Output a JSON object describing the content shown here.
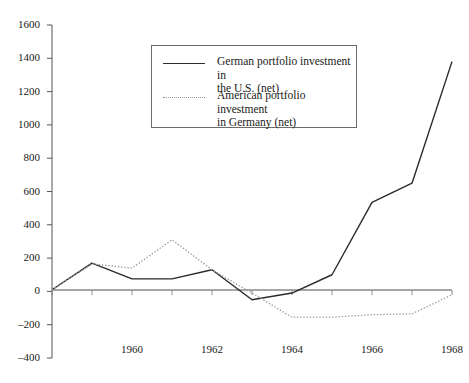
{
  "chart_data": {
    "type": "line",
    "title": "",
    "xlabel": "",
    "ylabel": "",
    "x": [
      1958,
      1959,
      1960,
      1961,
      1962,
      1963,
      1964,
      1965,
      1966,
      1967,
      1968
    ],
    "xlim": [
      1958,
      1968
    ],
    "ylim": [
      -400,
      1600
    ],
    "ytick_values": [
      -400,
      -200,
      0,
      200,
      400,
      600,
      800,
      1000,
      1200,
      1400,
      1600
    ],
    "ytick_labels": [
      "–400",
      "–200",
      "0",
      "200",
      "400",
      "600",
      "800",
      "1000",
      "1200",
      "1400",
      "1600"
    ],
    "xtick_values": [
      1960,
      1962,
      1964,
      1966,
      1968
    ],
    "xtick_labels": [
      "1960",
      "1962",
      "1964",
      "1966",
      "1968"
    ],
    "grid": false,
    "legend_position": "upper-center",
    "series": [
      {
        "name": "German portfolio investment in the U.S. (net)",
        "style": "solid",
        "color": "#2b2b2b",
        "values": [
          10,
          170,
          75,
          75,
          130,
          -50,
          -10,
          100,
          535,
          650,
          1380
        ]
      },
      {
        "name": "American portfolio investment in Germany (net)",
        "style": "dotted",
        "color": "#9a9a9a",
        "values": [
          10,
          165,
          140,
          310,
          130,
          -10,
          -155,
          -155,
          -140,
          -135,
          -20
        ]
      }
    ]
  },
  "legend": {
    "entries": [
      {
        "line1": "German portfolio investment in",
        "line2": "the U.S. (net)",
        "swatch": "solid-line-swatch"
      },
      {
        "line1": "American portfolio investment",
        "line2": "in Germany (net)",
        "swatch": "dotted-line-swatch"
      }
    ]
  }
}
